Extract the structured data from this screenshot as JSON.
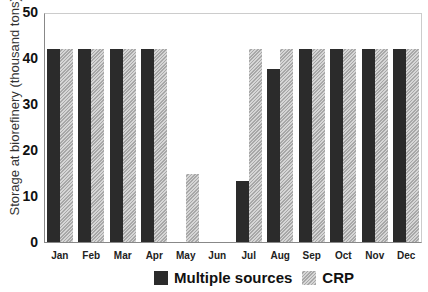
{
  "chart_data": {
    "type": "bar",
    "title": "",
    "xlabel": "",
    "ylabel": "Storage at biorefinery (thousand tons)",
    "ylim": [
      0,
      50
    ],
    "yticks": [
      0,
      10,
      20,
      30,
      40,
      50
    ],
    "grid": false,
    "legend_position": "bottom",
    "categories": [
      "Jan",
      "Feb",
      "Mar",
      "Apr",
      "May",
      "Jun",
      "Jul",
      "Aug",
      "Sep",
      "Oct",
      "Nov",
      "Dec"
    ],
    "series": [
      {
        "name": "Multiple sources",
        "color": "#2b2b2b",
        "pattern": "solid",
        "values": [
          42.2,
          42.2,
          42.2,
          42.2,
          0,
          0,
          13.3,
          37.8,
          42.2,
          42.2,
          42.2,
          42.2
        ]
      },
      {
        "name": "CRP",
        "color": "#bdbdbd",
        "pattern": "hatched",
        "values": [
          42.2,
          42.2,
          42.2,
          42.2,
          14.8,
          0,
          42.2,
          42.2,
          42.2,
          42.2,
          42.2,
          42.2
        ]
      }
    ]
  },
  "legend": {
    "multiple_sources": "Multiple sources",
    "crp": "CRP"
  }
}
